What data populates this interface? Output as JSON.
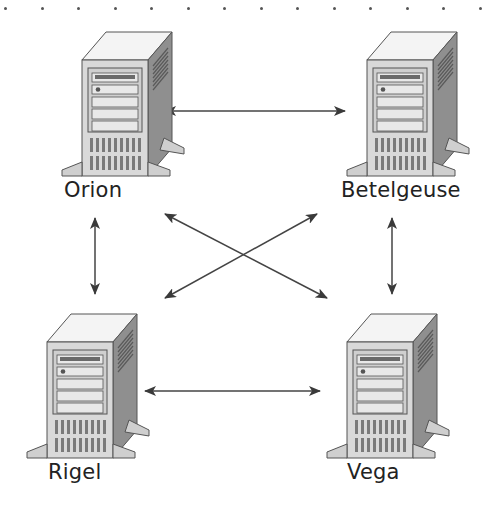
{
  "diagram": {
    "type": "network-topology",
    "colors": {
      "server_front": "#d9d9d9",
      "server_side": "#8c8c8c",
      "server_top": "#f4f4f4",
      "outline": "#555555",
      "arrow": "#444444",
      "label": "#222222"
    },
    "nodes": [
      {
        "id": "orion",
        "label": "Orion",
        "icon": "server-tower-icon",
        "x": 60,
        "y": 28,
        "label_x": 64,
        "label_y": 178
      },
      {
        "id": "betelgeuse",
        "label": "Betelgeuse",
        "icon": "server-tower-icon",
        "x": 345,
        "y": 28,
        "label_x": 341,
        "label_y": 178
      },
      {
        "id": "rigel",
        "label": "Rigel",
        "icon": "server-tower-icon",
        "x": 25,
        "y": 310,
        "label_x": 48,
        "label_y": 460
      },
      {
        "id": "vega",
        "label": "Vega",
        "icon": "server-tower-icon",
        "x": 325,
        "y": 310,
        "label_x": 347,
        "label_y": 460
      }
    ],
    "edges": [
      {
        "from": "orion",
        "to": "betelgeuse",
        "direction": "bidirectional",
        "x1": 165,
        "y1": 111,
        "x2": 345,
        "y2": 111
      },
      {
        "from": "orion",
        "to": "rigel",
        "direction": "bidirectional",
        "x1": 95,
        "y1": 218,
        "x2": 95,
        "y2": 294
      },
      {
        "from": "betelgeuse",
        "to": "vega",
        "direction": "bidirectional",
        "x1": 392,
        "y1": 218,
        "x2": 392,
        "y2": 294
      },
      {
        "from": "orion",
        "to": "vega",
        "direction": "bidirectional",
        "x1": 165,
        "y1": 214,
        "x2": 327,
        "y2": 298
      },
      {
        "from": "betelgeuse",
        "to": "rigel",
        "direction": "bidirectional",
        "x1": 317,
        "y1": 214,
        "x2": 165,
        "y2": 298
      },
      {
        "from": "rigel",
        "to": "vega",
        "direction": "bidirectional",
        "x1": 145,
        "y1": 391,
        "x2": 320,
        "y2": 391
      }
    ],
    "dotted_border": {
      "count": 14,
      "y": 7
    }
  }
}
